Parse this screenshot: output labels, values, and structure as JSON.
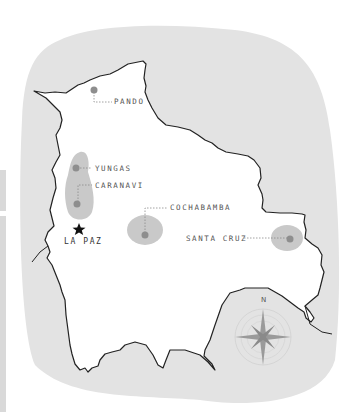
{
  "map": {
    "country": "Bolivia",
    "capital": {
      "name": "La Paz",
      "icon": "star-icon",
      "x": 79,
      "y": 229
    },
    "regions": [
      {
        "id": "pando",
        "label": "Pando",
        "dot": [
          94,
          90
        ],
        "label_pos": [
          114,
          97
        ]
      },
      {
        "id": "yungas",
        "label": "Yungas",
        "dot": [
          76,
          168
        ],
        "label_pos": [
          95,
          164
        ]
      },
      {
        "id": "caranavi",
        "label": "Caranavi",
        "dot": [
          77,
          204
        ],
        "label_pos": [
          95,
          181
        ]
      },
      {
        "id": "cochabamba",
        "label": "Cochabamba",
        "dot": [
          145,
          235
        ],
        "label_pos": [
          170,
          201
        ]
      },
      {
        "id": "santa-cruz",
        "label": "Santa Cruz",
        "dot": [
          290,
          239
        ],
        "label_pos": [
          186,
          235
        ]
      }
    ],
    "compass": {
      "north_label": "N",
      "cx": 263,
      "cy": 337
    },
    "colors": {
      "background_blob": "#e3e3e3",
      "land": "#ffffff",
      "border": "#222222",
      "region_area": "#c9c9c9",
      "region_dot": "#8e8e8e",
      "leader_line": "#8a8a8a",
      "label_text": "#555555",
      "compass": "#8f8f8f"
    }
  }
}
